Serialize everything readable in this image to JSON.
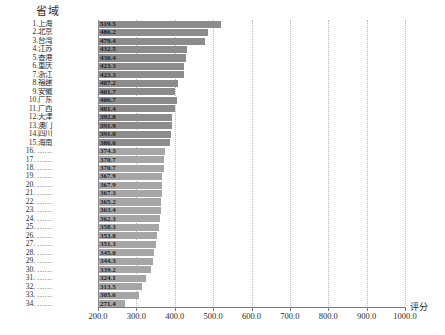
{
  "chart_data": {
    "type": "bar",
    "orientation": "horizontal",
    "title": "省域",
    "xlabel": "评分",
    "ylabel": "",
    "xlim": [
      200.0,
      1000.0
    ],
    "xticks": [
      "200.0",
      "300.0",
      "400.0",
      "500.0",
      "600.0",
      "700.0",
      "800.0",
      "900.0",
      "1000.0"
    ],
    "xtick_values": [
      200,
      300,
      400,
      500,
      600,
      700,
      800,
      900,
      1000
    ],
    "grid": "vertical-dotted",
    "legend": "none",
    "bar_color": "#9a9a9a",
    "categories": [
      "1.上海",
      "2.北京",
      "3.台湾",
      "4.江苏",
      "5.香港",
      "6.重庆",
      "7.浙江",
      "8.福建",
      "9.安徽",
      "10.广东",
      "11.广西",
      "12.天津",
      "13.澳门",
      "14.四川",
      "15.海南",
      "16. ……",
      "17. ……",
      "18. ……",
      "19. ……",
      "20. ……",
      "21. ……",
      "22. ……",
      "23. ……",
      "24. ……",
      "25. ……",
      "26. ……",
      "27. ……",
      "28. ……",
      "29. ……",
      "30. ……",
      "31. ……",
      "32. ……",
      "33. ……",
      "34. ……"
    ],
    "values": [
      519.5,
      486.2,
      479.4,
      432.5,
      430.4,
      423.3,
      423.3,
      407.2,
      401.7,
      406.7,
      401.4,
      392.8,
      391.9,
      391.0,
      386.6,
      374.3,
      370.7,
      370.7,
      367.9,
      367.9,
      367.3,
      365.2,
      363.4,
      362.3,
      358.3,
      353.8,
      351.3,
      345.0,
      344.3,
      339.2,
      324.1,
      313.5,
      305.6,
      271.4
    ],
    "value_labels": [
      "519.5",
      "486.2",
      "479.4",
      "432.5",
      "430.4",
      "423.3",
      "423.3",
      "407.2",
      "401.7",
      "406.7",
      "401.4",
      "392.8",
      "391.9",
      "391.0",
      "386.6",
      "374.3",
      "370.7",
      "370.7",
      "367.9",
      "367.9",
      "367.3",
      "365.2",
      "363.4",
      "362.3",
      "358.3",
      "353.8",
      "351.3",
      "345.0",
      "344.3",
      "339.2",
      "324.1",
      "313.5",
      "305.6",
      "271.4"
    ]
  }
}
